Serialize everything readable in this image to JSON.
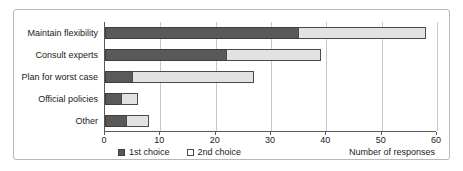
{
  "chart_data": {
    "type": "bar",
    "orientation": "horizontal",
    "stacked": true,
    "title": "",
    "xlabel": "Number of responses",
    "ylabel": "",
    "xlim": [
      0,
      60
    ],
    "xticks": [
      0,
      10,
      20,
      30,
      40,
      50,
      60
    ],
    "grid": true,
    "grid_axis": "x",
    "legend_position": "bottom-left",
    "categories": [
      "Maintain flexibility",
      "Consult experts",
      "Plan for worst case",
      "Official policies",
      "Other"
    ],
    "series": [
      {
        "name": "1st choice",
        "color": "#595959",
        "values": [
          35,
          22,
          5,
          3,
          4
        ]
      },
      {
        "name": "2nd choice",
        "color": "#e2e2e2",
        "values": [
          23,
          17,
          22,
          3,
          4
        ]
      }
    ],
    "totals": [
      58,
      39,
      27,
      6,
      8
    ]
  }
}
